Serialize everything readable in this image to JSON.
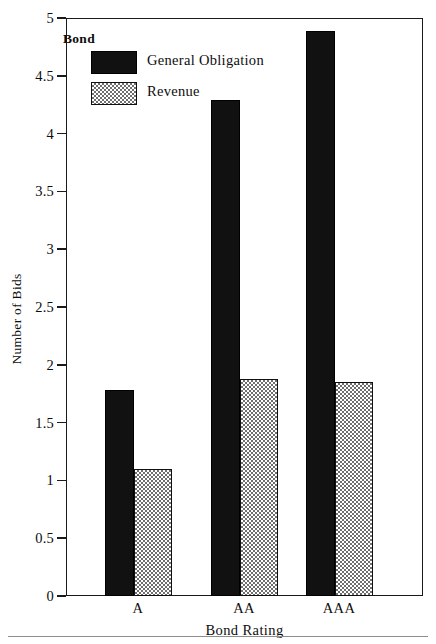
{
  "chart_data": {
    "type": "bar",
    "title": "",
    "xlabel": "Bond Rating",
    "ylabel": "Number of Bids",
    "categories": [
      "A",
      "AA",
      "AAA"
    ],
    "series": [
      {
        "name": "General Obligation",
        "values": [
          1.78,
          4.29,
          4.89
        ],
        "color": "#111111",
        "fill": "solid-black"
      },
      {
        "name": "Revenue",
        "values": [
          1.1,
          1.88,
          1.85
        ],
        "color": "#6f6f6f",
        "fill": "stipple-checker"
      }
    ],
    "ylim": [
      0,
      5
    ],
    "yticks": [
      "0",
      "0.5",
      "1",
      "1.5",
      "2",
      "2.5",
      "3",
      "3.5",
      "4",
      "4.5",
      "5"
    ],
    "ytick_values": [
      0,
      0.5,
      1,
      1.5,
      2,
      2.5,
      3,
      3.5,
      4,
      4.5,
      5
    ],
    "grid": false,
    "legend": {
      "title": "Bond",
      "position": "top-left-inside",
      "entries": [
        "General Obligation",
        "Revenue"
      ]
    }
  },
  "axes": {
    "y_title": "Number of Bids",
    "x_title": "Bond Rating"
  }
}
